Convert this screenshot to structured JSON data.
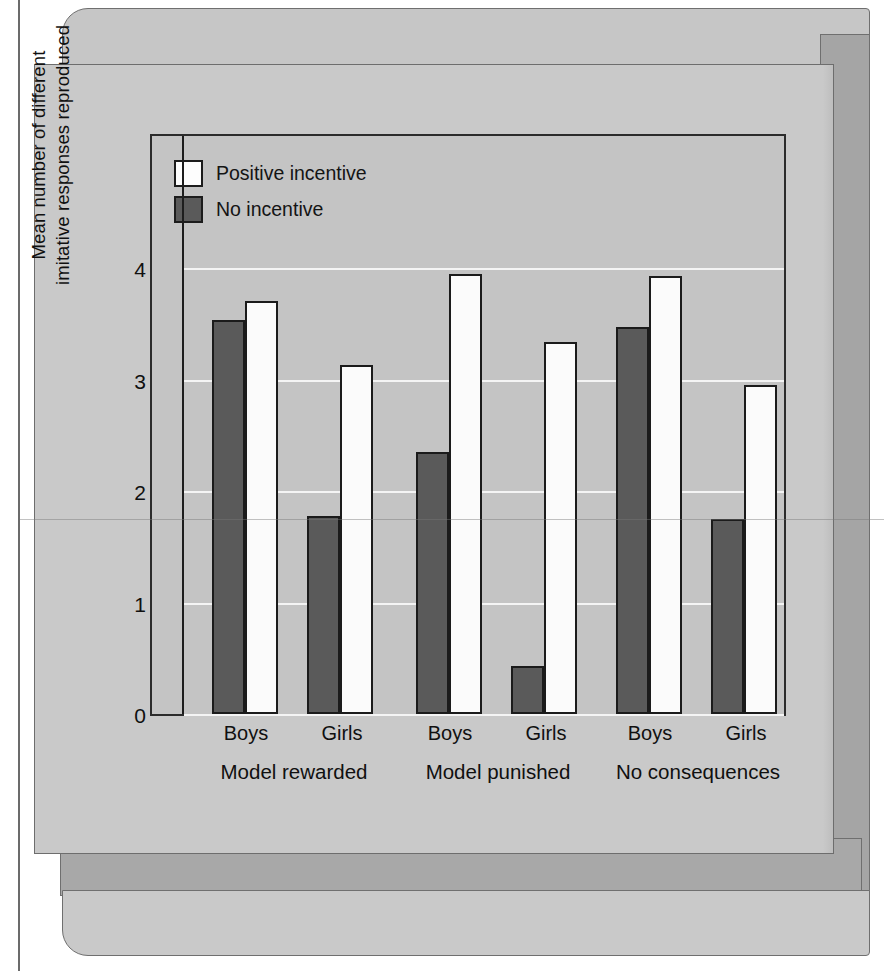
{
  "chart_data": {
    "type": "bar",
    "title": "",
    "xlabel": "",
    "ylabel_line1": "Mean number of different",
    "ylabel_line2": "imitative responses reproduced",
    "ylim": [
      0,
      4.35
    ],
    "yticks": [
      "0",
      "1",
      "2",
      "3",
      "4"
    ],
    "ytick_values": [
      0,
      1,
      2,
      3,
      4
    ],
    "grid": "horizontal gridlines at 1, 2, 3, 4",
    "legend_position": "top-left inside plot",
    "legend": [
      {
        "label": "Positive incentive",
        "style": "white",
        "color": "#fdfdfd"
      },
      {
        "label": "No incentive",
        "style": "dark",
        "color": "#5a5a5a"
      }
    ],
    "series": [
      {
        "name": "No incentive",
        "values": [
          3.53,
          1.78,
          2.35,
          0.43,
          3.47,
          1.75
        ]
      },
      {
        "name": "Positive incentive",
        "values": [
          3.7,
          3.13,
          3.95,
          3.34,
          3.93,
          2.95
        ]
      }
    ],
    "categories": [
      "Boys",
      "Girls",
      "Boys",
      "Girls",
      "Boys",
      "Girls"
    ],
    "group_labels": [
      "Model rewarded",
      "Model punished",
      "No consequences"
    ],
    "groups": [
      {
        "label": "Model rewarded",
        "bars": [
          {
            "category": "Boys",
            "no_incentive": 3.53,
            "positive_incentive": 3.7
          },
          {
            "category": "Girls",
            "no_incentive": 1.78,
            "positive_incentive": 3.13
          }
        ]
      },
      {
        "label": "Model punished",
        "bars": [
          {
            "category": "Boys",
            "no_incentive": 2.35,
            "positive_incentive": 3.95
          },
          {
            "category": "Girls",
            "no_incentive": 0.43,
            "positive_incentive": 3.34
          }
        ]
      },
      {
        "label": "No consequences",
        "bars": [
          {
            "category": "Boys",
            "no_incentive": 3.47,
            "positive_incentive": 3.93
          },
          {
            "category": "Girls",
            "no_incentive": 1.75,
            "positive_incentive": 2.95
          }
        ]
      }
    ],
    "colors": {
      "no_incentive": "#5a5a5a",
      "positive_incentive": "#fdfdfd",
      "bar_outline": "#1b1b1b",
      "panel_background": "#c9c9c9",
      "plot_background": "#c4c4c4",
      "gridline": "#f4f4f4"
    }
  }
}
